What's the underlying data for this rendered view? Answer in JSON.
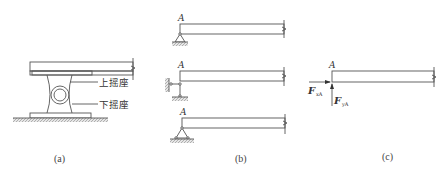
{
  "panels": {
    "a": {
      "caption": "(a)",
      "labels": {
        "upper_rocker": "上摇座",
        "lower_rocker": "下摇座"
      }
    },
    "b": {
      "caption": "(b)",
      "point_label_1": "A",
      "point_label_2": "A",
      "point_label_3": "A"
    },
    "c": {
      "caption": "(c)",
      "point_label": "A",
      "force_x": {
        "symbol": "F",
        "subscript": "xA"
      },
      "force_y": {
        "symbol": "F",
        "subscript": "yA"
      }
    }
  },
  "colors": {
    "line": "#555555",
    "hatch": "#9a9a9a"
  }
}
